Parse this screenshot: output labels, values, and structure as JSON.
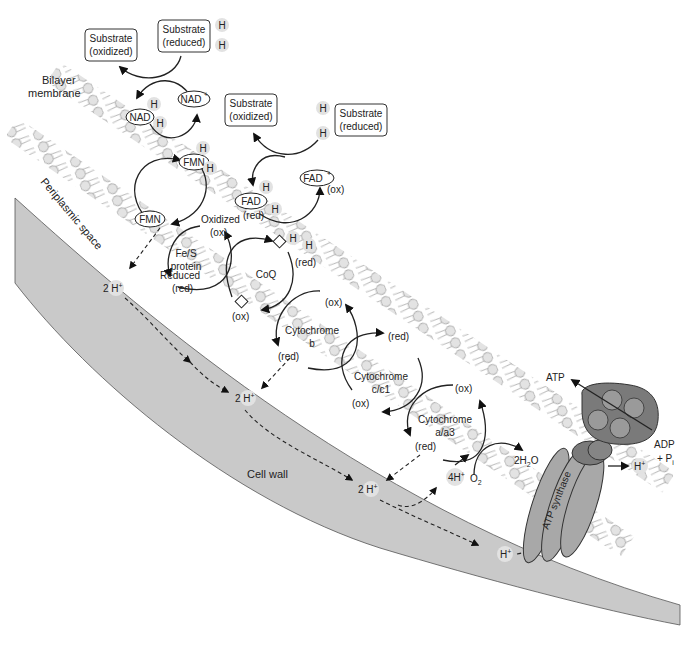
{
  "diagram": {
    "type": "bacterial electron transport chain",
    "regions": {
      "membrane_label_line1": "Bilayer",
      "membrane_label_line2": "membrane",
      "periplasm_label": "Periplasmic space",
      "cell_wall_label": "Cell wall"
    },
    "substrates": {
      "nad_oxidized_line1": "Substrate",
      "nad_oxidized_line2": "(oxidized)",
      "nad_reduced_line1": "Substrate",
      "nad_reduced_line2": "(reduced)",
      "fad_oxidized_line1": "Substrate",
      "fad_oxidized_line2": "(oxidized)",
      "fad_reduced_line1": "Substrate",
      "fad_reduced_line2": "(reduced)"
    },
    "hydrogen": "H",
    "carriers": {
      "nad": "NAD",
      "nad_plus": "NAD",
      "plus_sup": "+",
      "fmn_top": "FMN",
      "fmn_bottom": "FMN",
      "fad": "FAD",
      "fad_plus": "FAD",
      "fad_red": "(red)",
      "fad_ox": "(ox)",
      "fes_line1": "Fe/S",
      "fes_line2": "protein",
      "fes_oxidized": "Oxidized",
      "fes_ox": "(ox)",
      "fes_reduced": "Reduced",
      "fes_red": "(red)",
      "coq": "CoQ",
      "coq_red": "(red)",
      "coq_ox": "(ox)",
      "cytb_line1": "Cytochrome",
      "cytb_line2": "b",
      "cytb_ox": "(ox)",
      "cytb_red": "(red)",
      "cytc_line1": "Cytochrome",
      "cytc_line2": "c/c1",
      "cytc_red": "(red)",
      "cytc_ox": "(ox)",
      "cyta_line1": "Cytochrome",
      "cyta_line2": "a/a3",
      "cyta_ox": "(ox)",
      "cyta_red": "(red)"
    },
    "protons": {
      "h2_a": "2 H",
      "h2_b": "2 H",
      "h2_c": "2 H",
      "h4": "4H",
      "h_single": "H",
      "h_out": "H",
      "plus": "+"
    },
    "oxygen": {
      "o2": "O",
      "o2_sub": "2",
      "water": "2H",
      "water_sub": "2",
      "water_tail": "O"
    },
    "atp_synthase": {
      "label": "ATP synthase",
      "atp": "ATP",
      "adp": "ADP",
      "pi": "+ P",
      "pi_sub": "i"
    },
    "colors": {
      "cell_wall": "#c9c9c9",
      "lipid_head": "#e3e3e3",
      "synthase_dark": "#7a7a7a",
      "synthase_mid": "#9a9a9a",
      "synthase_light": "#a8a8a8",
      "stroke": "#222222"
    }
  }
}
